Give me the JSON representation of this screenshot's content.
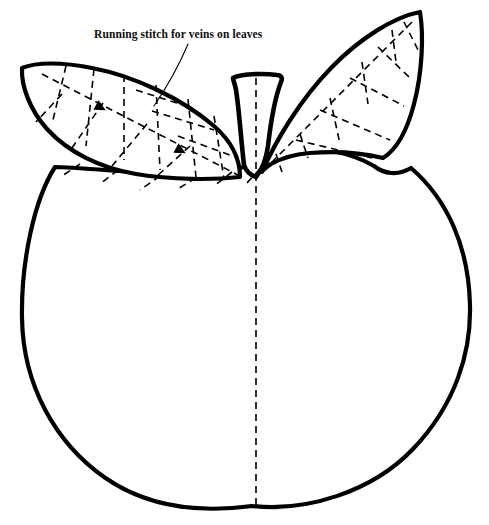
{
  "canvas": {
    "width": 489,
    "height": 525,
    "background_color": "#ffffff",
    "ink_color": "#000000"
  },
  "document": {
    "title": "Apple embroidery pattern template",
    "subject": "apple-with-two-leaves"
  },
  "annotation": {
    "label": "Running stitch for veins on leaves",
    "label_x": 94,
    "label_y": 38,
    "leader_line": {
      "from_x": 188,
      "from_y": 44,
      "to_x": 154,
      "to_y": 106
    }
  },
  "shapes": {
    "apple_body": {
      "name": "apple-body-outline",
      "stroke_width": 4.2,
      "leftmost_x": 21,
      "rightmost_x": 470,
      "bottom_y": 507,
      "path": "M 55 167 C 34 200, 21 262, 22 318 C 23 386, 56 443, 104 477 C 148 508, 200 513, 252 506 C 306 512, 372 492, 413 449 C 456 404, 471 352, 470 306 C 469 247, 447 199, 411 168 C 398 176, 384 174, 374 166 C 350 152, 318 146, 289 150 C 276 152, 264 157, 254 164 C 230 171, 206 176, 186 175 C 150 173, 116 171, 90 169 C 77 168, 65 167, 55 167 Z"
    },
    "stem": {
      "name": "apple-stem-outline",
      "stroke_width": 4.6,
      "path": "M 233 78 C 240 74, 262 73, 277 75 C 281 75, 283 78, 281 82 C 276 95, 271 120, 268 146 C 266 160, 262 170, 256 177 C 250 175, 246 171, 244 165 C 241 140, 239 108, 236 90 C 235 84, 233 80, 233 78 Z"
    },
    "left_leaf": {
      "name": "left-leaf-outline",
      "stroke_width": 4.2,
      "tip_x": 22,
      "tip_y": 68,
      "base_x": 240,
      "base_y": 177,
      "path": "M 22 68 C 36 62, 62 62, 92 68 C 134 76, 181 98, 214 126 C 230 140, 240 158, 240 177 C 213 180, 172 180, 136 174 C 100 168, 68 152, 47 129 C 30 110, 21 86, 22 68 Z"
    },
    "right_leaf": {
      "name": "right-leaf-outline",
      "stroke_width": 4.2,
      "tip_x": 420,
      "tip_y": 12,
      "base_x": 262,
      "base_y": 172,
      "path": "M 420 12 C 424 36, 422 74, 414 104 C 407 131, 396 150, 383 158 C 362 153, 334 151, 310 153 C 296 154, 282 158, 271 164 C 265 168, 262 171, 262 172 C 276 140, 300 100, 331 68 C 360 38, 394 17, 420 12 Z"
    }
  },
  "stitch_lines": {
    "style": "running-stitch-dashed",
    "dash_pattern": "7 5",
    "stroke_width": 1.6,
    "center_fold_line": {
      "name": "center-fold-dashed-line",
      "x": 256,
      "from_y": 78,
      "to_y": 506
    },
    "left_leaf_midrib": {
      "name": "left-leaf-midrib-stitch",
      "path": "M 42 74 L 240 176"
    },
    "left_leaf_veins": [
      "M 66 66 L 52 124",
      "M 94 69 L 86 146",
      "M 124 75 L 124 160",
      "M 156 85 L 160 170",
      "M 188 99 L 196 177",
      "M 214 116 L 224 179",
      "M 62 94 L 36 122",
      "M 103 103 L 72 148",
      "M 147 124 L 112 166",
      "M 190 146 L 156 177",
      "M 136 90 L 180 104",
      "M 152 111 L 214 130",
      "M 178 136 L 238 158"
    ],
    "left_leaf_arrows": [
      {
        "x": 96,
        "y": 105,
        "angle": 28
      },
      {
        "x": 176,
        "y": 148,
        "angle": 28
      }
    ],
    "right_leaf_midrib": {
      "name": "right-leaf-midrib-stitch",
      "path": "M 412 22 L 264 170"
    },
    "right_leaf_veins": [
      "M 404 22 L 418 50",
      "M 378 47 L 410 78",
      "M 350 78 L 404 106",
      "M 320 110 L 390 140",
      "M 296 140 L 372 158",
      "M 392 30 L 396 62",
      "M 362 62 L 368 104",
      "M 330 98 L 340 144",
      "M 300 134 L 308 158",
      "M 276 154 L 282 172",
      "M 268 160 L 246 184",
      "M 232 172 L 214 186",
      "M 196 178 L 176 190",
      "M 160 176 L 140 190",
      "M 118 170 L 100 184",
      "M 80 164 L 62 176"
    ]
  }
}
